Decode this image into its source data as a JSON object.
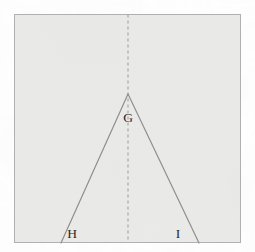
{
  "figure": {
    "canvas": {
      "width": 255,
      "height": 252
    },
    "background_color": "#ffffff",
    "panel": {
      "name": "figure-panel",
      "x": 14,
      "y": 14,
      "width": 227,
      "height": 229,
      "fill_color": "#ededeb",
      "border_color": "#b0b0b0",
      "border_width": 1
    },
    "symmetry_axis": {
      "name": "axis-of-symmetry",
      "style": "dashed",
      "color": "#9b9b93",
      "x": 128,
      "y_top": 14,
      "y_bottom": 243,
      "dash_pattern": "3,3",
      "stroke_width": 1
    },
    "apex": {
      "x": 128,
      "y": 94
    },
    "legs": [
      {
        "name": "left-leg",
        "from_x": 128,
        "from_y": 94,
        "to_x": 61,
        "to_y": 243,
        "color": "#8f8f8f",
        "stroke_width": 1.2
      },
      {
        "name": "right-leg",
        "from_x": 128,
        "from_y": 94,
        "to_x": 199,
        "to_y": 243,
        "color": "#8f8f8f",
        "stroke_width": 1.2
      }
    ],
    "labels": [
      {
        "id": "label-g",
        "text": "G",
        "x": 128,
        "y": 122,
        "color": "#2a2a2a"
      },
      {
        "id": "label-h",
        "text": "H",
        "x": 72,
        "y": 238,
        "color": "#2a2a2a"
      },
      {
        "id": "label-i",
        "text": "I",
        "x": 178,
        "y": 238,
        "color": "#2a2a2a"
      }
    ]
  }
}
